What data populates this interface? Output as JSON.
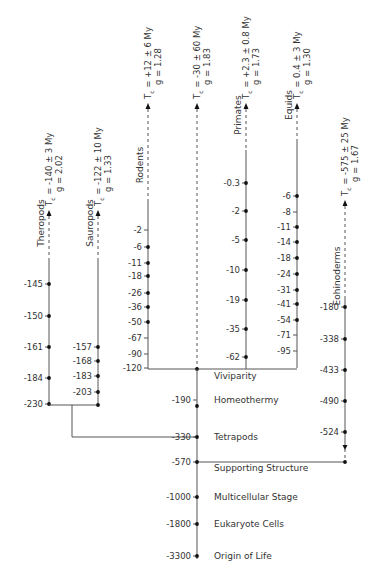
{
  "chart_data": {
    "type": "tree",
    "title": "",
    "trunk": {
      "name": "Main lineage",
      "events": [
        {
          "label": "Viviparity",
          "value": -120
        },
        {
          "label": "Homeothermy",
          "value": -190
        },
        {
          "label": "Tetrapods",
          "value": -330
        },
        {
          "label": "Supporting Structure",
          "value": -570
        },
        {
          "label": "Multicellular Stage",
          "value": -1000
        },
        {
          "label": "Eukaryote Cells",
          "value": -1800
        },
        {
          "label": "Origin of Life",
          "value": -3300
        }
      ]
    },
    "branches": [
      {
        "name": "Theropods",
        "tc": "Tₐ = -140 ± 3 My",
        "tc_main": "T",
        "tc_sub": "c",
        "tc_rest": " = -140 ± 3 My",
        "g": "g = 2.02",
        "ticks": [
          "-145",
          "-150",
          "-161",
          "-184",
          "-230"
        ],
        "dots": [
          true,
          true,
          true,
          true,
          true
        ]
      },
      {
        "name": "Sauropods",
        "tc_main": "T",
        "tc_sub": "c",
        "tc_rest": " = -122 ± 10 My",
        "g": "g = 1.33",
        "ticks": [
          "-157",
          "-168",
          "-183",
          "-203"
        ],
        "dots": [
          true,
          true,
          true,
          true
        ]
      },
      {
        "name": "Rodents",
        "tc_main": "T",
        "tc_sub": "c",
        "tc_rest": " = +12 ± 6 My",
        "g": "g = 1.28",
        "ticks": [
          "-2",
          "-6",
          "-11",
          "-18",
          "-26",
          "-36",
          "-50",
          "-67",
          "-90",
          "-120"
        ],
        "dots": [
          false,
          true,
          true,
          true,
          true,
          true,
          true,
          false,
          false,
          false
        ]
      },
      {
        "name": "",
        "tc_main": "T",
        "tc_sub": "c",
        "tc_rest": " = -30 ± 60 My",
        "g": "g = 1.83",
        "ticks": [],
        "dots": []
      },
      {
        "name": "Primates",
        "tc_main": "T",
        "tc_sub": "c",
        "tc_rest": " = +2.3 ± 0.8 My",
        "g": "g = 1.73",
        "ticks": [
          "-0.3",
          "-2",
          "-5",
          "-10",
          "-19",
          "-35",
          "-62"
        ],
        "dots": [
          true,
          true,
          true,
          true,
          true,
          true,
          true
        ]
      },
      {
        "name": "Equids",
        "tc_main": "T",
        "tc_sub": "c",
        "tc_rest": " = 0.4 ± 3 My",
        "g": "g = 1.30",
        "ticks": [
          "-6",
          "-8",
          "-11",
          "-14",
          "-18",
          "-24",
          "-31",
          "-41",
          "-54",
          "-71",
          "-95"
        ],
        "dots": [
          true,
          false,
          true,
          true,
          true,
          true,
          true,
          true,
          true,
          false,
          false
        ]
      },
      {
        "name": "Eohinoderms",
        "tc_main": "T",
        "tc_sub": "c",
        "tc_rest": " = -575 ± 25 My",
        "g": "g = 1.67",
        "ticks": [
          "-180",
          "-338",
          "-433",
          "-490",
          "-524"
        ],
        "dots": [
          true,
          true,
          true,
          true,
          true
        ]
      }
    ]
  }
}
